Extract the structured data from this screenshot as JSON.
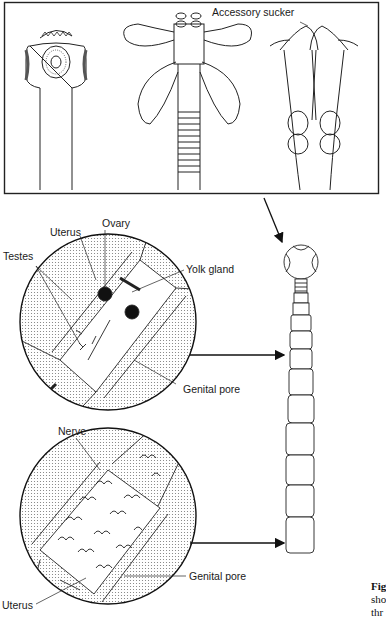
{
  "figure": {
    "top_panel": {
      "label_accessory_sucker": "Accessory sucker",
      "scolices": [
        "hooked-scolex-with-suckers",
        "bothridia-scolex-with-accessory-suckers",
        "split-bothria-scolex"
      ]
    },
    "mature_proglottid": {
      "labels": {
        "uterus": "Uterus",
        "ovary": "Ovary",
        "testes": "Testes",
        "yolk_gland": "Yolk gland",
        "genital_pore": "Genital pore"
      }
    },
    "gravid_proglottid": {
      "labels": {
        "nerve": "Nerve",
        "genital_pore": "Genital pore",
        "uterus": "Uterus"
      }
    },
    "whole_worm": {
      "segments": 12
    },
    "caption": {
      "line1": "Fig",
      "line2": "sho",
      "line3": "thr"
    },
    "colors": {
      "ink": "#1a1a1a",
      "background": "#ffffff",
      "stipple": "#9a9a9a"
    }
  }
}
